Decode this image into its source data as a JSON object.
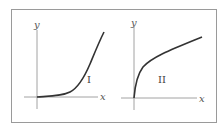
{
  "figure": {
    "panels": [
      {
        "id": "I",
        "label": "I",
        "x_axis_label": "x",
        "y_axis_label": "y",
        "curve": "convex increasing (flat near origin, rising steeply)"
      },
      {
        "id": "II",
        "label": "II",
        "x_axis_label": "x",
        "y_axis_label": "y",
        "curve": "concave increasing (steep near origin, flattening)"
      }
    ],
    "colors": {
      "axis": "#8a8a8a",
      "curve": "#333333",
      "frame": "#9a9a9a"
    }
  }
}
